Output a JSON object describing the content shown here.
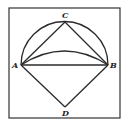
{
  "figure": {
    "type": "geometry-diagram",
    "points": [
      {
        "id": "A",
        "label": "A"
      },
      {
        "id": "B",
        "label": "B"
      },
      {
        "id": "C",
        "label": "C"
      },
      {
        "id": "D",
        "label": "D"
      }
    ],
    "segments": [
      "AC",
      "CB",
      "AB",
      "AD",
      "DB"
    ],
    "arcs": [
      "outer semicircle A-C-B",
      "inner arc A-B"
    ],
    "colors": {
      "line": "#2a2a2a",
      "background": "#ffffff"
    }
  }
}
